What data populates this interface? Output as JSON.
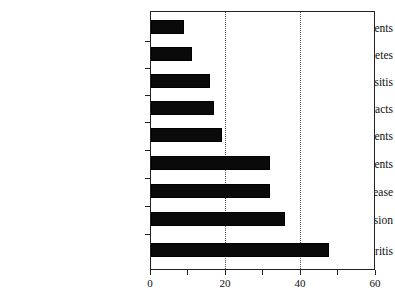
{
  "chart_data": {
    "type": "bar",
    "orientation": "horizontal",
    "title": "",
    "subtitle": "",
    "xlabel": "",
    "ylabel": "",
    "categories": [
      "Visual impairments",
      "Diabetes",
      "Sinusitis",
      "Cataracts",
      "Orthopedic impairments",
      "Hearing impairments",
      "Heart disease",
      "Hypertension",
      "Arthritis"
    ],
    "values": [
      9,
      11,
      16,
      17,
      19,
      32,
      32,
      36,
      48
    ],
    "xlim": [
      0,
      60
    ],
    "xticks": [
      0,
      20,
      40,
      60
    ],
    "xtick_labels": [
      "0",
      "20",
      "40",
      "60"
    ],
    "gridlines_x": [
      20,
      40
    ],
    "grid": true,
    "grid_style": "dotted",
    "legend": null,
    "bar_color": "#0a0a0a",
    "frame_color": "#222222",
    "background_color": "#ffffff"
  },
  "axis": {
    "x_tick_labels": [
      "0",
      "20",
      "40",
      "60"
    ],
    "y_tick_labels": [
      "Visual impairments",
      "Diabetes",
      "Sinusitis",
      "Cataracts",
      "Orthopedic impairments",
      "Hearing impairments",
      "Heart disease",
      "Hypertension",
      "Arthritis"
    ]
  }
}
